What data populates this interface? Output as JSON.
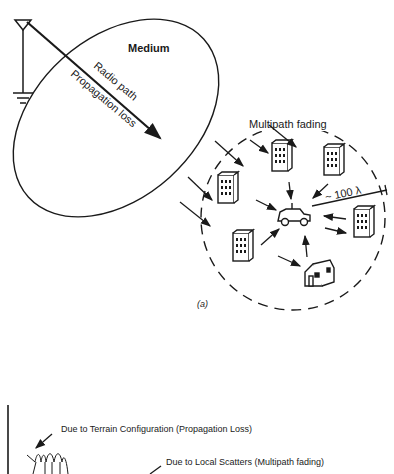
{
  "figure_a": {
    "medium_label": "Medium",
    "radio_path_label": "Radio path",
    "propagation_loss_label": "Propagation loss",
    "multipath_label": "Multipath fading",
    "distance_label": "~ 100 λ",
    "caption": "(a)"
  },
  "figure_b": {
    "terrain_label": "Due to Terrain Configuration (Propagation Loss)",
    "scatter_label": "Due to Local Scatters (Multipath fading)"
  },
  "colors": {
    "ink": "#1a1a1a",
    "background": "#ffffff"
  }
}
